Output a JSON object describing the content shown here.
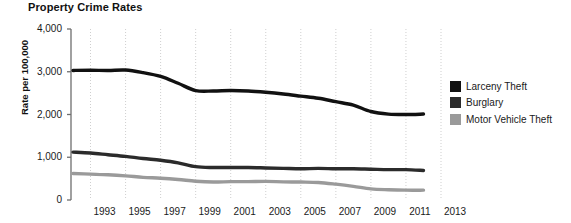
{
  "chart_data": {
    "type": "line",
    "title": "Property Crime Rates",
    "xlabel": "",
    "ylabel": "Rate per 100,000",
    "xlim": [
      1992,
      2013
    ],
    "ylim": [
      0,
      4000
    ],
    "grid": true,
    "legend_position": "right",
    "y_ticks": [
      "0",
      "1,000",
      "2,000",
      "3,000",
      "4,000"
    ],
    "y_tick_values": [
      0,
      1000,
      2000,
      3000,
      4000
    ],
    "x_ticks": [
      "1993",
      "1995",
      "1997",
      "1999",
      "2001",
      "2003",
      "2005",
      "2007",
      "2009",
      "2011",
      "2013"
    ],
    "x_tick_values": [
      1993,
      1995,
      1997,
      1999,
      2001,
      2003,
      2005,
      2007,
      2009,
      2011,
      2013
    ],
    "x": [
      1992,
      1993,
      1994,
      1995,
      1996,
      1997,
      1998,
      1999,
      2000,
      2001,
      2002,
      2003,
      2004,
      2005,
      2006,
      2007,
      2008,
      2009,
      2010,
      2011,
      2012
    ],
    "series": [
      {
        "name": "Larceny Theft",
        "color": "#111111",
        "values": [
          3030,
          3035,
          3030,
          3040,
          2980,
          2890,
          2730,
          2560,
          2550,
          2560,
          2550,
          2520,
          2480,
          2430,
          2380,
          2300,
          2220,
          2070,
          2010,
          2000,
          2010
        ]
      },
      {
        "name": "Burglary",
        "color": "#2b2b2b",
        "values": [
          1120,
          1100,
          1060,
          1020,
          970,
          930,
          870,
          780,
          760,
          760,
          760,
          750,
          740,
          730,
          740,
          730,
          730,
          720,
          710,
          710,
          690
        ]
      },
      {
        "name": "Motor Vehicle Theft",
        "color": "#9a9a9a",
        "values": [
          620,
          605,
          590,
          565,
          530,
          510,
          480,
          440,
          420,
          430,
          430,
          435,
          425,
          420,
          410,
          370,
          320,
          260,
          240,
          230,
          230
        ]
      }
    ],
    "legend": [
      {
        "label": "Larceny Theft",
        "color": "#111111"
      },
      {
        "label": "Burglary",
        "color": "#2b2b2b"
      },
      {
        "label": "Motor Vehicle Theft",
        "color": "#9a9a9a"
      }
    ]
  }
}
